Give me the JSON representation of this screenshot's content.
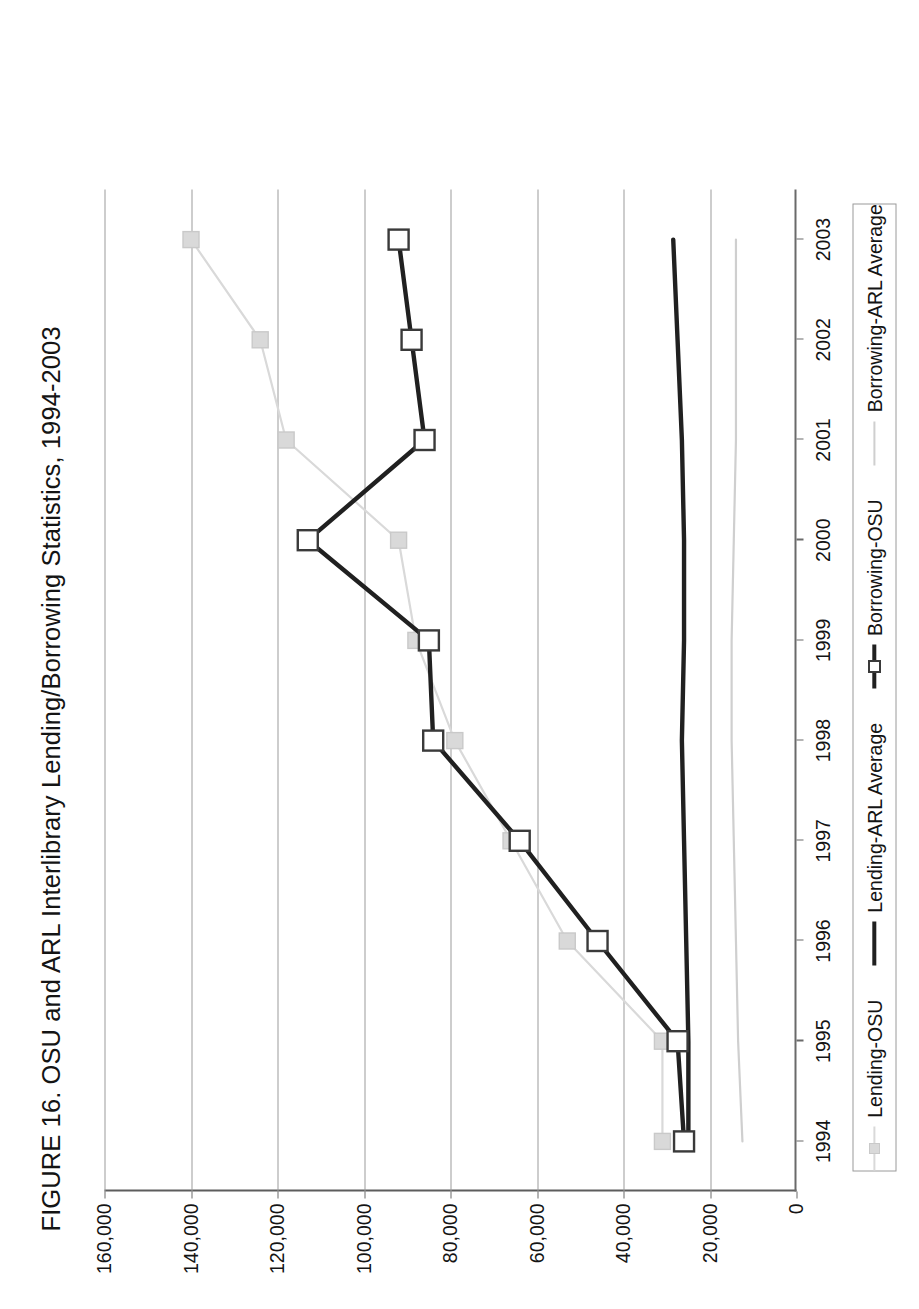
{
  "title": "FIGURE 16. OSU and ARL Interlibrary Lending/Borrowing Statistics, 1994-2003",
  "legend": {
    "position": "bottom",
    "items": [
      {
        "label": "Lending-OSU",
        "color": "#d9d9d9",
        "marker": "square",
        "line_width": 2.2,
        "marker_fill": "#d9d9d9",
        "marker_stroke": "#c9c9c9"
      },
      {
        "label": "Lending-ARL Average",
        "color": "#202020",
        "marker": "none",
        "line_width": 4.4,
        "marker_fill": "none",
        "marker_stroke": "none"
      },
      {
        "label": "Borrowing-OSU",
        "color": "#202020",
        "marker": "square",
        "line_width": 4.4,
        "marker_fill": "#ffffff",
        "marker_stroke": "#3a3a3a"
      },
      {
        "label": "Borrowing-ARL Average",
        "color": "#cfcfcf",
        "marker": "none",
        "line_width": 2.2,
        "marker_fill": "none",
        "marker_stroke": "none"
      }
    ]
  },
  "chart_data": {
    "type": "line",
    "title": "FIGURE 16. OSU and ARL Interlibrary Lending/Borrowing Statistics, 1994-2003",
    "xlabel": "",
    "ylabel": "",
    "categories": [
      "1994",
      "1995",
      "1996",
      "1997",
      "1998",
      "1999",
      "2000",
      "2001",
      "2002",
      "2003"
    ],
    "x": [
      1994,
      1995,
      1996,
      1997,
      1998,
      1999,
      2000,
      2001,
      2002,
      2003
    ],
    "ylim": [
      0,
      160000
    ],
    "yticks": [
      0,
      20000,
      40000,
      60000,
      80000,
      100000,
      120000,
      140000,
      160000
    ],
    "ytick_labels": [
      "0",
      "20,000",
      "40,000",
      "60,000",
      "80,000",
      "100,000",
      "120,000",
      "140,000",
      "160,000"
    ],
    "grid": true,
    "grid_axis": "y",
    "legend_position": "bottom",
    "series": [
      {
        "name": "Lending-OSU",
        "color": "#d9d9d9",
        "values": [
          31000,
          31000,
          53000,
          66000,
          79000,
          88000,
          92000,
          118000,
          124000,
          140000
        ]
      },
      {
        "name": "Lending-ARL Average",
        "color": "#202020",
        "values": [
          25000,
          25000,
          25500,
          26000,
          26500,
          26000,
          26000,
          26500,
          27500,
          28500
        ]
      },
      {
        "name": "Borrowing-OSU",
        "color": "#202020",
        "values": [
          26000,
          27500,
          46000,
          64000,
          84000,
          85000,
          113000,
          86000,
          89000,
          92000
        ]
      },
      {
        "name": "Borrowing-ARL Average",
        "color": "#cfcfcf",
        "values": [
          12500,
          13500,
          14000,
          14500,
          15000,
          15000,
          14500,
          14000,
          14000,
          14000
        ]
      }
    ]
  },
  "axis": {
    "y_tick_labels": [
      "160,000",
      "140,000",
      "120,000",
      "100,000",
      "80,000",
      "60,000",
      "40,000",
      "20,000",
      "0"
    ],
    "x_tick_labels": [
      "1994",
      "1995",
      "1996",
      "1997",
      "1998",
      "1999",
      "2000",
      "2001",
      "2002",
      "2003"
    ]
  },
  "colors": {
    "axis": "#6a6a6a",
    "gridline": "#9b9b9b",
    "text": "#141414",
    "dark_series": "#202020",
    "light_series": "#d9d9d9",
    "lighter_series": "#cfcfcf",
    "background": "#ffffff"
  }
}
